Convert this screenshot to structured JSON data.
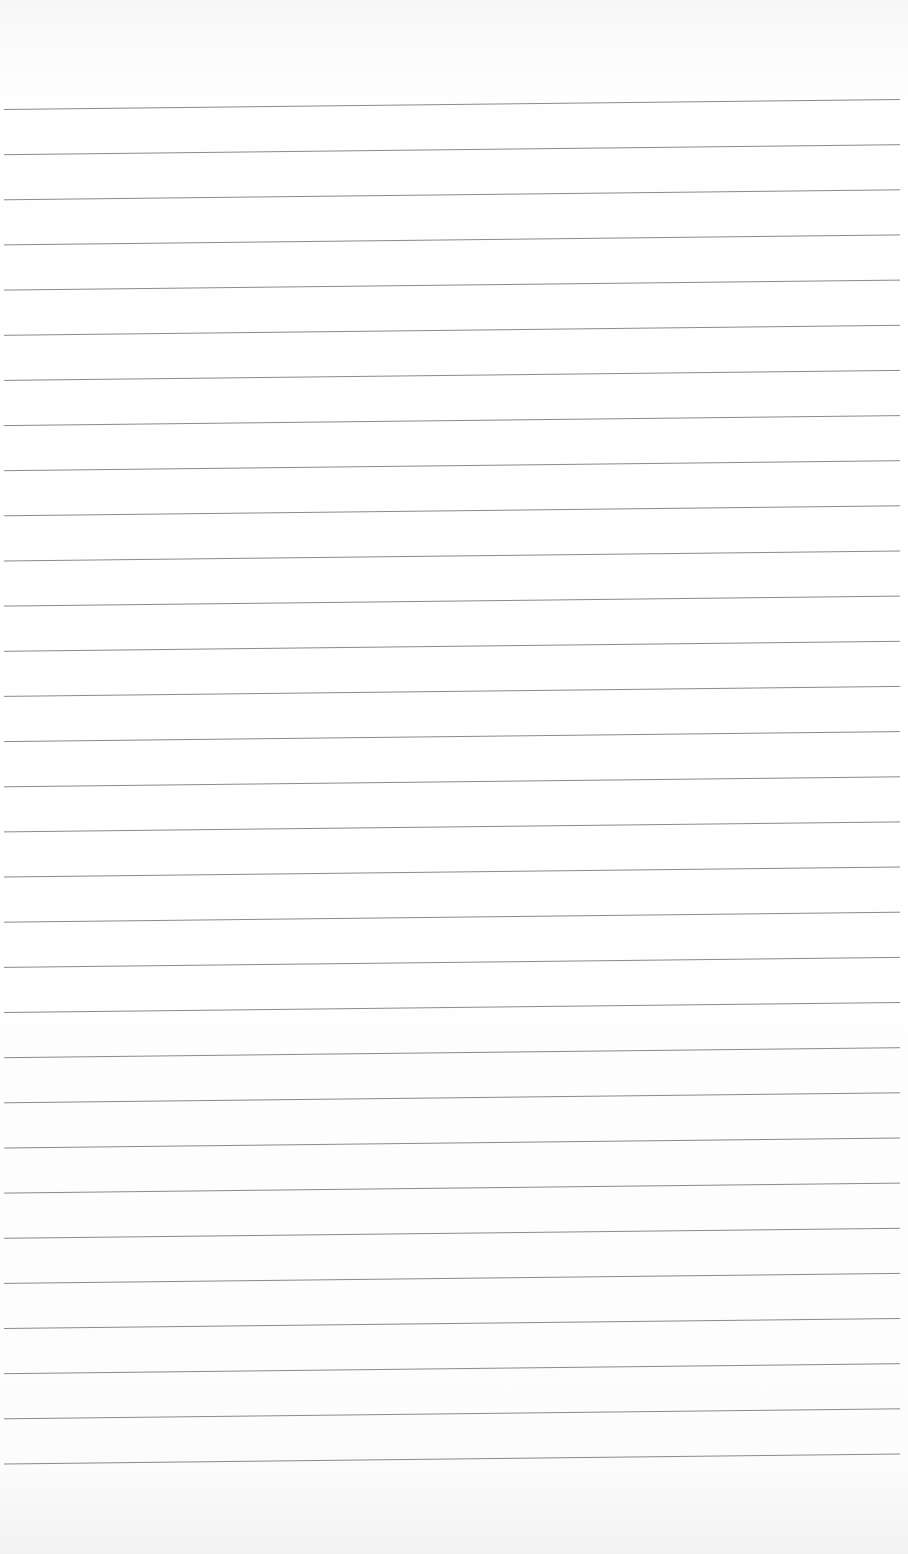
{
  "page": {
    "type": "blank ruled paper",
    "background_color": "#ffffff",
    "line_color": "#8a8a8a",
    "line_count": 31,
    "first_line_y_left": 109.5,
    "line_spacing": 45.15,
    "line_x_start": 4,
    "line_x_end": 900,
    "line_rise_left_to_right": 10,
    "text": ""
  }
}
